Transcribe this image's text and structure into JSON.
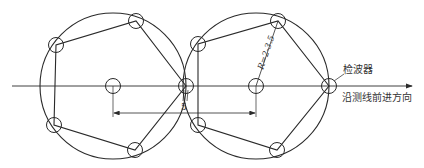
{
  "diagram": {
    "type": "geophone-array-layout",
    "labels": {
      "geophone": "检波器",
      "direction": "沿测线前进方向",
      "radius": "R=2-3.5",
      "spacing_small": "5"
    },
    "colors": {
      "line": "#2a2a2a",
      "text": "#333333",
      "background": "#ffffff"
    },
    "arrays": [
      {
        "name": "left-array",
        "center": [
          113,
          86
        ],
        "radius": 73,
        "vertices": [
          [
            186,
            86
          ],
          [
            136,
            21
          ],
          [
            56,
            45
          ],
          [
            54,
            125
          ],
          [
            135,
            150
          ]
        ]
      },
      {
        "name": "right-array",
        "center": [
          256,
          86
        ],
        "radius": 73,
        "vertices": [
          [
            329,
            86
          ],
          [
            278,
            21
          ],
          [
            198,
            44
          ],
          [
            198,
            125
          ],
          [
            277,
            150
          ]
        ]
      }
    ]
  }
}
